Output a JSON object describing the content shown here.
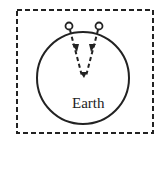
{
  "diagram": {
    "label": "Earth",
    "colors": {
      "stroke": "#222222",
      "background": "#ffffff"
    }
  }
}
